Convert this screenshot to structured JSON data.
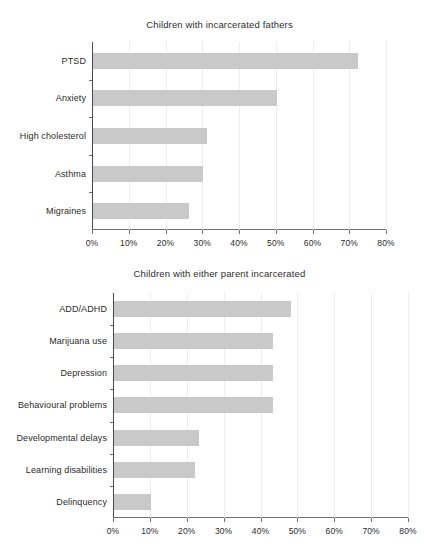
{
  "chart_data": [
    {
      "type": "bar",
      "orientation": "horizontal",
      "title": "Children with incarcerated fathers",
      "xlabel": "",
      "ylabel": "",
      "categories": [
        "PTSD",
        "Anxiety",
        "High cholesterol",
        "Asthma",
        "Migraines"
      ],
      "values": [
        72,
        50,
        31,
        30,
        26
      ],
      "xlim": [
        0,
        80
      ],
      "xticks": [
        0,
        10,
        20,
        30,
        40,
        50,
        60,
        70,
        80
      ],
      "xtick_labels": [
        "0%",
        "10%",
        "20%",
        "30%",
        "40%",
        "50%",
        "60%",
        "70%",
        "80%"
      ],
      "grid": true,
      "legend": false,
      "bar_color": "#c9c9c9",
      "axis_color": "#6e6e6e",
      "grid_color": "#ededed"
    },
    {
      "type": "bar",
      "orientation": "horizontal",
      "title": "Children with either parent incarcerated",
      "xlabel": "",
      "ylabel": "",
      "categories": [
        "ADD/ADHD",
        "Marijuana use",
        "Depression",
        "Behavioural problems",
        "Developmental delays",
        "Learning disabilities",
        "Delinquency"
      ],
      "values": [
        48,
        43,
        43,
        43,
        23,
        22,
        10
      ],
      "xlim": [
        0,
        80
      ],
      "xticks": [
        0,
        10,
        20,
        30,
        40,
        50,
        60,
        70,
        80
      ],
      "xtick_labels": [
        "0%",
        "10%",
        "20%",
        "30%",
        "40%",
        "50%",
        "60%",
        "70%",
        "80%"
      ],
      "grid": true,
      "legend": false,
      "bar_color": "#c9c9c9",
      "axis_color": "#6e6e6e",
      "grid_color": "#ededed"
    }
  ]
}
